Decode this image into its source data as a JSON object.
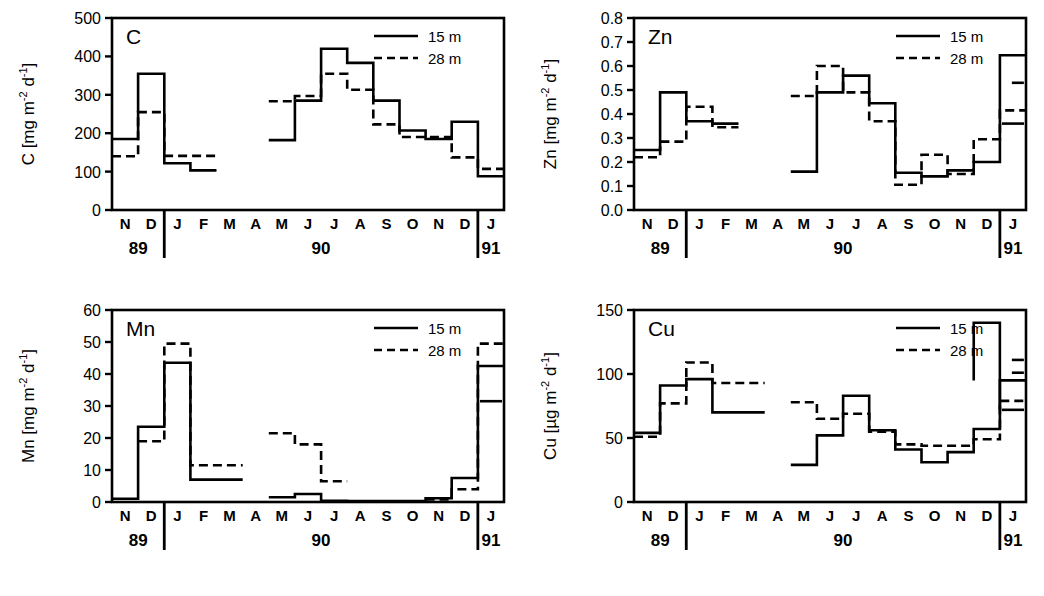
{
  "figure": {
    "title": "",
    "legend_labels": [
      "15 m",
      "28 m"
    ],
    "months": [
      "N",
      "D",
      "J",
      "F",
      "M",
      "A",
      "M",
      "J",
      "J",
      "A",
      "S",
      "O",
      "N",
      "D",
      "J"
    ],
    "years": [
      "89",
      "90",
      "91"
    ],
    "line_color": "#000000",
    "background": "#ffffff"
  },
  "panels": [
    {
      "id": "C",
      "letter": "C",
      "axis_label_prefix": "C [mg m",
      "axis_label_sup1": "-2",
      "axis_label_mid": " d",
      "axis_label_sup2": "-1",
      "axis_label_suffix": "]",
      "unit": "mg m-2 d-1"
    },
    {
      "id": "Zn",
      "letter": "Zn",
      "axis_label_prefix": "Zn [mg m",
      "axis_label_sup1": "-2",
      "axis_label_mid": " d",
      "axis_label_sup2": "-1",
      "axis_label_suffix": "]",
      "unit": "mg m-2 d-1"
    },
    {
      "id": "Mn",
      "letter": "Mn",
      "axis_label_prefix": "Mn [mg m",
      "axis_label_sup1": "-2",
      "axis_label_mid": " d",
      "axis_label_sup2": "-1",
      "axis_label_suffix": "]",
      "unit": "mg m-2 d-1"
    },
    {
      "id": "Cu",
      "letter": "Cu",
      "axis_label_prefix": "Cu [µg m",
      "axis_label_sup1": "-2",
      "axis_label_mid": " d",
      "axis_label_sup2": "-1",
      "axis_label_suffix": "]",
      "unit": "µg m-2 d-1"
    }
  ],
  "chart_data": [
    {
      "type": "line",
      "title": "C",
      "xlabel": "",
      "ylabel": "C [mg m-2 d-1]",
      "ylim": [
        0,
        500
      ],
      "yticks": [
        0,
        100,
        200,
        300,
        400,
        500
      ],
      "ytick_labels": [
        "0",
        "100",
        "200",
        "300",
        "400",
        "500"
      ],
      "grid": false,
      "legend_position": "top-right",
      "x": [
        "N89",
        "D89",
        "J90",
        "F90",
        "M90",
        "A90",
        "M90b",
        "J90a",
        "J90b",
        "A90",
        "S90",
        "O90",
        "N90",
        "D90",
        "J91"
      ],
      "series": [
        {
          "name": "15 m",
          "style": "solid",
          "values": [
            185,
            355,
            122,
            103,
            null,
            null,
            182,
            285,
            420,
            383,
            285,
            207,
            185,
            230,
            88
          ]
        },
        {
          "name": "28 m",
          "style": "dashed",
          "values": [
            140,
            255,
            141,
            141,
            null,
            null,
            283,
            297,
            355,
            313,
            223,
            190,
            190,
            137,
            107
          ]
        }
      ]
    },
    {
      "type": "line",
      "title": "Zn",
      "xlabel": "",
      "ylabel": "Zn [mg m-2 d-1]",
      "ylim": [
        0.0,
        0.8
      ],
      "yticks": [
        0.0,
        0.1,
        0.2,
        0.3,
        0.4,
        0.5,
        0.6,
        0.7,
        0.8
      ],
      "ytick_labels": [
        "0.0",
        "0.1",
        "0.2",
        "0.3",
        "0.4",
        "0.5",
        "0.6",
        "0.7",
        "0.8"
      ],
      "grid": false,
      "legend_position": "top-right",
      "x": [
        "N89",
        "D89",
        "J90",
        "F90",
        "M90",
        "A90",
        "M90b",
        "J90a",
        "J90b",
        "A90",
        "S90",
        "O90",
        "N90",
        "D90",
        "J91"
      ],
      "series": [
        {
          "name": "15 m",
          "style": "solid",
          "values": [
            0.25,
            0.49,
            0.37,
            0.36,
            null,
            null,
            0.16,
            0.49,
            0.56,
            0.445,
            0.155,
            0.14,
            0.165,
            0.2,
            0.645
          ]
        },
        {
          "name": "28 m",
          "style": "dashed",
          "values": [
            0.22,
            0.285,
            0.43,
            0.345,
            null,
            null,
            0.475,
            0.6,
            0.49,
            0.37,
            0.105,
            0.23,
            0.15,
            0.295,
            0.415
          ]
        }
      ],
      "trailing_markers": [
        {
          "series": "15 m",
          "value": 0.36
        },
        {
          "series": "28 m",
          "value": 0.53
        }
      ]
    },
    {
      "type": "line",
      "title": "Mn",
      "xlabel": "",
      "ylabel": "Mn [mg m-2 d-1]",
      "ylim": [
        0,
        60
      ],
      "yticks": [
        0,
        10,
        20,
        30,
        40,
        50,
        60
      ],
      "ytick_labels": [
        "0",
        "10",
        "20",
        "30",
        "40",
        "50",
        "60"
      ],
      "grid": false,
      "legend_position": "top-right",
      "x": [
        "N89",
        "D89",
        "J90",
        "F90",
        "M90",
        "A90",
        "M90b",
        "J90a",
        "J90b",
        "A90",
        "S90",
        "O90",
        "N90",
        "D90",
        "J91"
      ],
      "series": [
        {
          "name": "15 m",
          "style": "solid",
          "values": [
            1.0,
            23.5,
            43.5,
            7.0,
            7.0,
            null,
            1.5,
            2.5,
            0.4,
            0.3,
            0.3,
            0.3,
            1.2,
            7.5,
            42.5
          ]
        },
        {
          "name": "28 m",
          "style": "dashed",
          "values": [
            null,
            19.0,
            49.5,
            11.5,
            11.5,
            null,
            21.5,
            18.0,
            6.5,
            null,
            null,
            null,
            0.8,
            4.0,
            49.5
          ]
        }
      ],
      "trailing_markers": [
        {
          "series": "15 m",
          "value": 31.5
        }
      ]
    },
    {
      "type": "line",
      "title": "Cu",
      "xlabel": "",
      "ylabel": "Cu [µg m-2 d-1]",
      "ylim": [
        0,
        150
      ],
      "yticks": [
        0,
        50,
        100,
        150
      ],
      "ytick_labels": [
        "0",
        "50",
        "100",
        "150"
      ],
      "grid": false,
      "legend_position": "top-right",
      "x": [
        "N89",
        "D89",
        "J90",
        "F90",
        "M90",
        "A90",
        "M90b",
        "J90a",
        "J90b",
        "A90",
        "S90",
        "O90",
        "N90",
        "D90",
        "J91"
      ],
      "series": [
        {
          "name": "15 m",
          "style": "solid",
          "values": [
            54,
            91,
            96,
            70,
            70,
            null,
            29,
            52,
            83,
            56,
            41,
            31,
            39,
            57,
            95
          ]
        },
        {
          "name": "28 m",
          "style": "dashed",
          "values": [
            51,
            77,
            109,
            93,
            93,
            null,
            78,
            65,
            69,
            55,
            45,
            44,
            44,
            49,
            79
          ]
        }
      ],
      "peak": {
        "series": "15 m",
        "value": 140,
        "at": "D90"
      },
      "trailing_markers": [
        {
          "series": "15 m",
          "value": 72
        },
        {
          "series": "28 m",
          "value": 101
        },
        {
          "series": "28 m_extra",
          "value": 111
        }
      ]
    }
  ]
}
